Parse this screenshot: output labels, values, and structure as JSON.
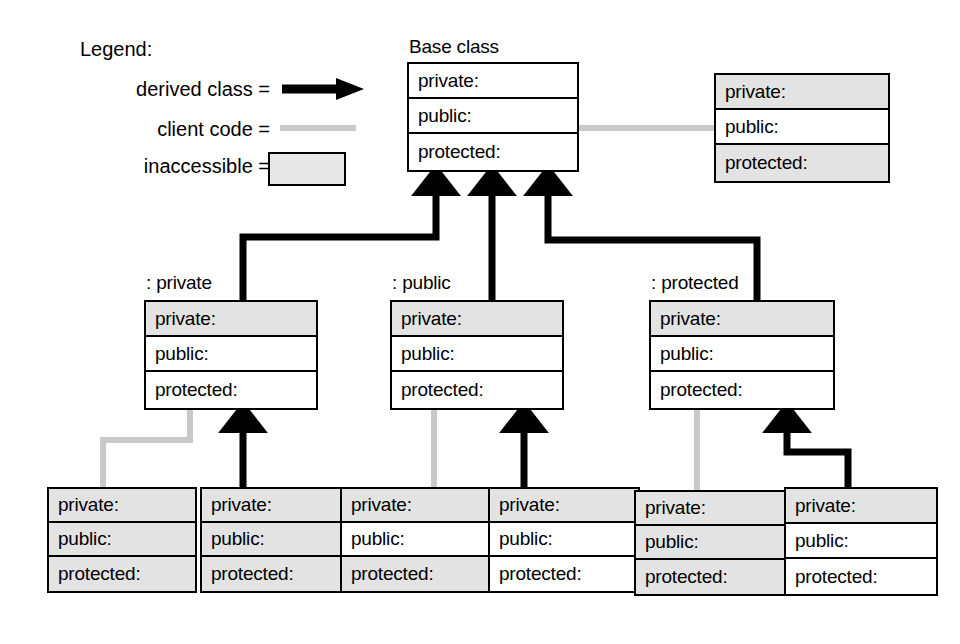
{
  "diagram": {
    "colors": {
      "line": "#000000",
      "client_line": "#c9c9c9",
      "inaccessible_fill": "#e3e3e3",
      "accessible_fill": "#ffffff",
      "background": "#ffffff"
    }
  },
  "legend": {
    "title": "Legend:",
    "items": [
      {
        "label": "derived class =",
        "symbol": "solid-black-arrow"
      },
      {
        "label": "client code =",
        "symbol": "gray-line"
      },
      {
        "label": "inaccessible =",
        "symbol": "gray-filled-box"
      }
    ]
  },
  "rows": {
    "private": "private:",
    "public": "public:",
    "protected": "protected:"
  },
  "boxes": [
    {
      "id": "base-class",
      "caption": "Base class",
      "rows": [
        {
          "label": "private:",
          "inaccessible": false
        },
        {
          "label": "public:",
          "inaccessible": false
        },
        {
          "label": "protected:",
          "inaccessible": false
        }
      ]
    },
    {
      "id": "base-client",
      "caption": "",
      "rows": [
        {
          "label": "private:",
          "inaccessible": true
        },
        {
          "label": "public:",
          "inaccessible": false
        },
        {
          "label": "protected:",
          "inaccessible": true
        }
      ]
    },
    {
      "id": "derived-private",
      "caption": ": private",
      "rows": [
        {
          "label": "private:",
          "inaccessible": true
        },
        {
          "label": "public:",
          "inaccessible": false
        },
        {
          "label": "protected:",
          "inaccessible": false
        }
      ]
    },
    {
      "id": "derived-public",
      "caption": ": public",
      "rows": [
        {
          "label": "private:",
          "inaccessible": true
        },
        {
          "label": "public:",
          "inaccessible": false
        },
        {
          "label": "protected:",
          "inaccessible": false
        }
      ]
    },
    {
      "id": "derived-protected",
      "caption": ": protected",
      "rows": [
        {
          "label": "private:",
          "inaccessible": true
        },
        {
          "label": "public:",
          "inaccessible": false
        },
        {
          "label": "protected:",
          "inaccessible": false
        }
      ]
    },
    {
      "id": "private-client",
      "caption": "",
      "rows": [
        {
          "label": "private:",
          "inaccessible": true
        },
        {
          "label": "public:",
          "inaccessible": true
        },
        {
          "label": "protected:",
          "inaccessible": true
        }
      ]
    },
    {
      "id": "private-derived",
      "caption": "",
      "rows": [
        {
          "label": "private:",
          "inaccessible": true
        },
        {
          "label": "public:",
          "inaccessible": true
        },
        {
          "label": "protected:",
          "inaccessible": true
        }
      ]
    },
    {
      "id": "public-client",
      "caption": "",
      "rows": [
        {
          "label": "private:",
          "inaccessible": true
        },
        {
          "label": "public:",
          "inaccessible": false
        },
        {
          "label": "protected:",
          "inaccessible": true
        }
      ]
    },
    {
      "id": "public-derived",
      "caption": "",
      "rows": [
        {
          "label": "private:",
          "inaccessible": true
        },
        {
          "label": "public:",
          "inaccessible": false
        },
        {
          "label": "protected:",
          "inaccessible": false
        }
      ]
    },
    {
      "id": "protected-client",
      "caption": "",
      "rows": [
        {
          "label": "private:",
          "inaccessible": true
        },
        {
          "label": "public:",
          "inaccessible": true
        },
        {
          "label": "protected:",
          "inaccessible": true
        }
      ]
    },
    {
      "id": "protected-derived",
      "caption": "",
      "rows": [
        {
          "label": "private:",
          "inaccessible": true
        },
        {
          "label": "public:",
          "inaccessible": false
        },
        {
          "label": "protected:",
          "inaccessible": false
        }
      ]
    }
  ],
  "connections": [
    {
      "from": "derived-private",
      "to": "base-class",
      "kind": "derived class"
    },
    {
      "from": "derived-public",
      "to": "base-class",
      "kind": "derived class"
    },
    {
      "from": "derived-protected",
      "to": "base-class",
      "kind": "derived class"
    },
    {
      "from": "base-client",
      "to": "base-class",
      "kind": "client code"
    },
    {
      "from": "private-client",
      "to": "derived-private",
      "kind": "client code"
    },
    {
      "from": "private-derived",
      "to": "derived-private",
      "kind": "derived class"
    },
    {
      "from": "public-client",
      "to": "derived-public",
      "kind": "client code"
    },
    {
      "from": "public-derived",
      "to": "derived-public",
      "kind": "derived class"
    },
    {
      "from": "protected-client",
      "to": "derived-protected",
      "kind": "client code"
    },
    {
      "from": "protected-derived",
      "to": "derived-protected",
      "kind": "derived class"
    }
  ]
}
